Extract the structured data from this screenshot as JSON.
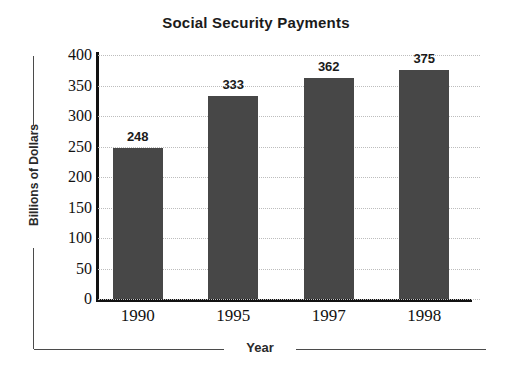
{
  "chart_data": {
    "type": "bar",
    "title": "Social Security Payments",
    "xlabel": "Year",
    "ylabel": "Billions of Dollars",
    "categories": [
      "1990",
      "1995",
      "1997",
      "1998"
    ],
    "values": [
      248,
      333,
      362,
      375
    ],
    "value_labels": [
      "248",
      "333",
      "362",
      "375"
    ],
    "ylim": [
      0,
      400
    ],
    "ytick_labels": [
      "400",
      "350",
      "300",
      "250",
      "200",
      "150",
      "100",
      "50",
      "0"
    ],
    "ytick_values": [
      400,
      350,
      300,
      250,
      200,
      150,
      100,
      50,
      0
    ],
    "grid": true,
    "grid_style": "dotted-horizontal",
    "legend": "none",
    "bar_color": "#474747",
    "axis_color": "#111111",
    "grid_color": "#bdbdbd",
    "background_color": "#ffffff",
    "text_color": "#1b1b1b"
  }
}
